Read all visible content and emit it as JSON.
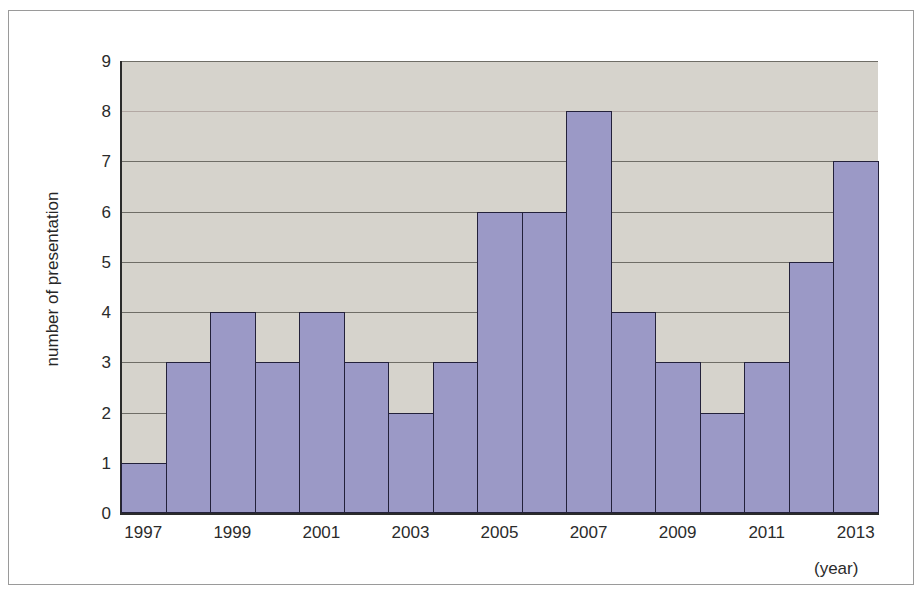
{
  "chart_data": {
    "type": "bar",
    "title": "",
    "subtitle": "",
    "xlabel": "(year)",
    "ylabel": "number of presentation",
    "categories": [
      "1997",
      "1998",
      "1999",
      "2000",
      "2001",
      "2002",
      "2003",
      "2004",
      "2005",
      "2006",
      "2007",
      "2008",
      "2009",
      "2010",
      "2011",
      "2012",
      "2013"
    ],
    "values": [
      1,
      3,
      4,
      3,
      4,
      3,
      2,
      3,
      6,
      6,
      8,
      4,
      3,
      2,
      3,
      5,
      7
    ],
    "x_tick_labels": [
      "1997",
      "1999",
      "2001",
      "2003",
      "2005",
      "2007",
      "2009",
      "2011",
      "2013"
    ],
    "x_tick_categories": [
      "1997",
      "1999",
      "2001",
      "2003",
      "2005",
      "2007",
      "2009",
      "2011",
      "2013"
    ],
    "y_tick_labels": [
      "0",
      "1",
      "2",
      "3",
      "4",
      "5",
      "6",
      "7",
      "8",
      "9"
    ],
    "ylim": [
      0,
      9
    ],
    "xlim_categories": 17,
    "grid": "horizontal",
    "legend": "none",
    "bar_fill_color": "#9b99c6",
    "bar_edge_color": "#23213a",
    "plot_background_color": "#d6d3cc",
    "figure_background_color": "#ffffff",
    "gridline_color": "#6f6d66",
    "axis_color": "#2b2b2b",
    "frame_border_color": "#9a9a9a"
  },
  "axes": {
    "y_title": "number of presentation",
    "x_unit_label": "(year)"
  }
}
